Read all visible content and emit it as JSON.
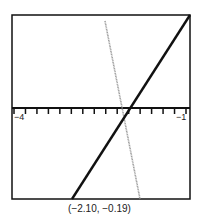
{
  "chart_data": {
    "type": "line",
    "title": "",
    "xlabel": "",
    "ylabel": "",
    "xlim": [
      -4,
      -1
    ],
    "x_tick_step": 0.2,
    "x_tick_labels": [
      "-4",
      "-1"
    ],
    "grid": false,
    "series": [
      {
        "name": "line-1",
        "color": "#111111",
        "style": "solid-thick",
        "points": [
          [
            -3.0,
            "bottom"
          ],
          [
            -1.0,
            "top"
          ]
        ]
      },
      {
        "name": "line-2",
        "color": "#999999",
        "style": "dotted-gray",
        "points": [
          [
            -2.38,
            "top"
          ],
          [
            -1.95,
            "bottom"
          ]
        ]
      }
    ],
    "intersection": {
      "x": -2.1,
      "y": -0.19
    },
    "caption": "(−2.10, −0.19)"
  },
  "axis": {
    "left_label": "−4",
    "right_label": "−1"
  },
  "caption": "(−2.10, −0.19)"
}
